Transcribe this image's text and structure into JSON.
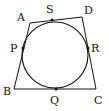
{
  "diagram": {
    "stroke_color": "#111111",
    "background": "#ffffff",
    "quadrilateral": {
      "vertices": [
        {
          "name": "A",
          "x": 30,
          "y": 23,
          "label_x": 17,
          "label_y": 21
        },
        {
          "name": "D",
          "x": 82,
          "y": 17,
          "label_x": 84,
          "label_y": 14
        },
        {
          "name": "C",
          "x": 96,
          "y": 89,
          "label_x": 94,
          "label_y": 104
        },
        {
          "name": "B",
          "x": 14,
          "y": 89,
          "label_x": 3,
          "label_y": 95
        }
      ]
    },
    "circle": {
      "cx": 55,
      "cy": 55,
      "r": 33
    },
    "tangent_points": [
      {
        "name": "S",
        "x": 52,
        "y": 20,
        "label_x": 46,
        "label_y": 13
      },
      {
        "name": "R",
        "x": 88,
        "y": 48,
        "label_x": 91,
        "label_y": 52
      },
      {
        "name": "Q",
        "x": 56,
        "y": 89,
        "label_x": 50,
        "label_y": 104
      },
      {
        "name": "P",
        "x": 23,
        "y": 48,
        "label_x": 10,
        "label_y": 52
      }
    ]
  }
}
